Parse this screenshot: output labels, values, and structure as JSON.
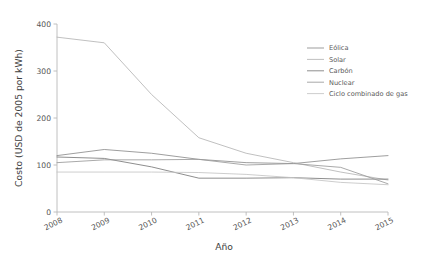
{
  "chart_data": {
    "type": "line",
    "title": "",
    "xlabel": "Año",
    "ylabel": "Costo (USD de 2005 por kWh)",
    "x": [
      2008,
      2009,
      2010,
      2011,
      2012,
      2013,
      2014,
      2015
    ],
    "xtick_labels": [
      "2008",
      "2009",
      "2010",
      "2011",
      "2012",
      "2013",
      "2014",
      "2015"
    ],
    "ytick_labels": [
      "0",
      "100",
      "200",
      "300",
      "400"
    ],
    "yticks": [
      0,
      100,
      200,
      300,
      400
    ],
    "xlim": [
      2008,
      2015
    ],
    "ylim": [
      0,
      400
    ],
    "grid": false,
    "legend_position": "upper right",
    "series": [
      {
        "name": "Eólica",
        "color": "#8c8c8c",
        "values": [
          120,
          133,
          125,
          112,
          105,
          103,
          113,
          120
        ]
      },
      {
        "name": "Solar",
        "color": "#b5b5b5",
        "values": [
          372,
          360,
          250,
          158,
          125,
          105,
          85,
          68
        ]
      },
      {
        "name": "Carbón",
        "color": "#7a7a7a",
        "values": [
          117,
          114,
          96,
          72,
          72,
          73,
          70,
          70
        ]
      },
      {
        "name": "Nuclear",
        "color": "#9a9a9a",
        "values": [
          105,
          111,
          111,
          112,
          100,
          103,
          95,
          60
        ]
      },
      {
        "name": "Ciclo combinado de gas",
        "color": "#c4c4c4",
        "values": [
          85,
          85,
          85,
          84,
          80,
          73,
          63,
          58
        ]
      }
    ]
  },
  "axes": {
    "x_title": "Año",
    "y_title": "Costo (USD de 2005 por kWh)"
  },
  "legend": {
    "items": [
      {
        "label": "Eólica"
      },
      {
        "label": "Solar"
      },
      {
        "label": "Carbón"
      },
      {
        "label": "Nuclear"
      },
      {
        "label": "Ciclo combinado de gas"
      }
    ]
  }
}
